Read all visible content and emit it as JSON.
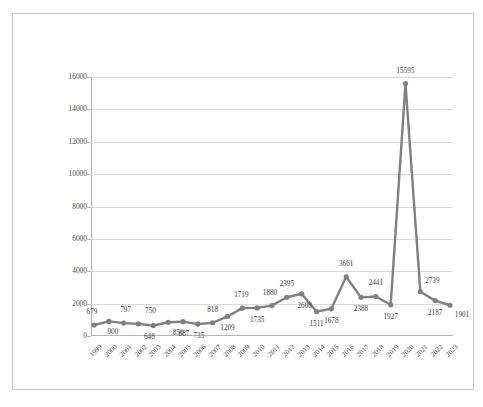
{
  "chart_data": {
    "type": "line",
    "title": "",
    "subtitle": "",
    "xlabel": "",
    "ylabel": "",
    "legend": [],
    "legend_position": "none",
    "grid": true,
    "series_color": "#808080",
    "marker": "circle",
    "ylim": [
      0,
      16000
    ],
    "ytick_labels": [
      "0",
      "2000",
      "4000",
      "6000",
      "8000",
      "10000",
      "12000",
      "14000",
      "16000"
    ],
    "ytick_values": [
      0,
      2000,
      4000,
      6000,
      8000,
      10000,
      12000,
      14000,
      16000
    ],
    "categories": [
      "1999",
      "2000",
      "2001",
      "2002",
      "2003",
      "2004",
      "2005",
      "2006",
      "2007",
      "2008",
      "2009",
      "2010",
      "2011",
      "2012",
      "2013",
      "2014",
      "2015",
      "2016",
      "2017",
      "2018",
      "2019",
      "2020",
      "2021",
      "2022",
      "2023"
    ],
    "values": [
      679,
      900,
      797,
      750,
      648,
      850,
      887,
      735,
      818,
      1209,
      1719,
      1735,
      1880,
      2395,
      2608,
      1511,
      1678,
      3661,
      2388,
      2441,
      1927,
      15595,
      2739,
      2187,
      1901
    ],
    "point_labels": [
      "679",
      "900",
      "797",
      "750",
      "648",
      "850",
      "887",
      "735",
      "818",
      "1209",
      "1719",
      "1735",
      "1880",
      "2395",
      "2608",
      "1511",
      "1678",
      "3661",
      "2388",
      "2441",
      "1927",
      "15595",
      "2739",
      "2187",
      "1901"
    ],
    "note_overlapping_labels": [
      "67990",
      "79750",
      "64850",
      "887",
      "735"
    ]
  },
  "plot": {
    "points": [
      {
        "year": "1999",
        "value": 679,
        "label": "679",
        "lx": -2,
        "ly": -12
      },
      {
        "year": "2000",
        "value": 900,
        "label": "900",
        "lx": 4,
        "ly": 12
      },
      {
        "year": "2001",
        "value": 797,
        "label": "797",
        "lx": 2,
        "ly": -12
      },
      {
        "year": "2002",
        "value": 750,
        "label": "750",
        "lx": 12,
        "ly": -12
      },
      {
        "year": "2003",
        "value": 648,
        "label": "648",
        "lx": -4,
        "ly": 12
      },
      {
        "year": "2004",
        "value": 850,
        "label": "850",
        "lx": 10,
        "ly": 12
      },
      {
        "year": "2005",
        "value": 887,
        "label": "887",
        "lx": 1,
        "ly": 13
      },
      {
        "year": "2006",
        "value": 735,
        "label": "735",
        "lx": 1,
        "ly": 13
      },
      {
        "year": "2007",
        "value": 818,
        "label": "818",
        "lx": 0,
        "ly": -12
      },
      {
        "year": "2008",
        "value": 1209,
        "label": "1209",
        "lx": 0,
        "ly": 13
      },
      {
        "year": "2009",
        "value": 1719,
        "label": "1719",
        "lx": -1,
        "ly": -12
      },
      {
        "year": "2010",
        "value": 1735,
        "label": "1735",
        "lx": 0,
        "ly": 13
      },
      {
        "year": "2011",
        "value": 1880,
        "label": "1880",
        "lx": -2,
        "ly": -12
      },
      {
        "year": "2012",
        "value": 2395,
        "label": "2395",
        "lx": 0,
        "ly": -12
      },
      {
        "year": "2013",
        "value": 2608,
        "label": "2608",
        "lx": 3,
        "ly": 13
      },
      {
        "year": "2014",
        "value": 1511,
        "label": "1511",
        "lx": 0,
        "ly": 13
      },
      {
        "year": "2015",
        "value": 1678,
        "label": "1678",
        "lx": 0,
        "ly": 13
      },
      {
        "year": "2016",
        "value": 3661,
        "label": "3661",
        "lx": 0,
        "ly": -12
      },
      {
        "year": "2017",
        "value": 2388,
        "label": "2388",
        "lx": 0,
        "ly": 13
      },
      {
        "year": "2018",
        "value": 2441,
        "label": "2441",
        "lx": 0,
        "ly": -12
      },
      {
        "year": "2019",
        "value": 1927,
        "label": "1927",
        "lx": 0,
        "ly": 13
      },
      {
        "year": "2020",
        "value": 15595,
        "label": "15595",
        "lx": 0,
        "ly": -12
      },
      {
        "year": "2021",
        "value": 2739,
        "label": "2739",
        "lx": 12,
        "ly": -10
      },
      {
        "year": "2022",
        "value": 2187,
        "label": "2187",
        "lx": 0,
        "ly": 13
      },
      {
        "year": "2023",
        "value": 1901,
        "label": "1901",
        "lx": 12,
        "ly": 11
      }
    ]
  }
}
